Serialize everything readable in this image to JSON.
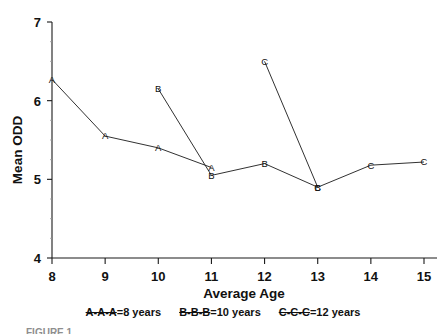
{
  "chart_data": {
    "type": "line",
    "title": "",
    "xlabel": "Average Age",
    "ylabel": "Mean ODD",
    "xlim": [
      8,
      15
    ],
    "ylim": [
      4,
      7
    ],
    "xticks": [
      8,
      9,
      10,
      11,
      12,
      13,
      14,
      15
    ],
    "yticks": [
      4,
      5,
      6,
      7
    ],
    "grid": false,
    "legend_position": "below-axis",
    "marker_style": "letter-coded",
    "series": [
      {
        "name": "A",
        "legend_key": "A-A-A",
        "legend_label": "=8 years",
        "marker": "A",
        "x": [
          8,
          9,
          10,
          11
        ],
        "values": [
          6.27,
          5.55,
          5.4,
          5.15
        ]
      },
      {
        "name": "B",
        "legend_key": "B-B-B",
        "legend_label": "=10 years",
        "marker": "B",
        "x": [
          10,
          11,
          12,
          13
        ],
        "values": [
          6.15,
          5.05,
          5.2,
          4.9
        ]
      },
      {
        "name": "C",
        "legend_key": "C-C-C",
        "legend_label": "=12 years",
        "marker": "C",
        "x": [
          12,
          13,
          14,
          15
        ],
        "values": [
          6.5,
          4.9,
          5.18,
          5.22
        ]
      }
    ]
  },
  "axes": {
    "x_title": "Average Age",
    "y_title": "Mean ODD",
    "x_tick_labels": [
      "8",
      "9",
      "10",
      "11",
      "12",
      "13",
      "14",
      "15"
    ],
    "y_tick_labels": [
      "4",
      "5",
      "6",
      "7"
    ]
  },
  "legend": {
    "entries": [
      {
        "key": "A-A-A",
        "label": "=8 years"
      },
      {
        "key": "B-B-B",
        "label": "=10 years"
      },
      {
        "key": "C-C-C",
        "label": "=12 years"
      }
    ]
  },
  "caption": {
    "partial_text": "FIGURE 1."
  }
}
